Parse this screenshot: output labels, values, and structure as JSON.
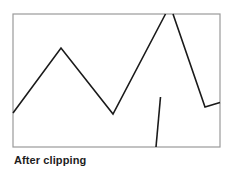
{
  "figure": {
    "caption": "After clipping",
    "caption_color": "#1d1d1d",
    "background_color": "#ffffff"
  },
  "clip_window": {
    "name": "clipping-rectangle",
    "x": 13,
    "y": 14,
    "width": 207,
    "height": 133,
    "stroke_color": "#9a9a9a",
    "stroke_width": 1.2,
    "fill_color": "#ffffff"
  },
  "chart_data": {
    "type": "line",
    "title": "After clipping",
    "xlabel": "",
    "ylabel": "",
    "grid": false,
    "legend": "none",
    "xlim": [
      13,
      220
    ],
    "ylim": [
      147,
      14
    ],
    "note": "Polyline clipped to the rectangular window; segments outside the window are removed and the peak is cut off at the top border.",
    "series": [
      {
        "name": "clipped-polyline-main",
        "stroke_color": "#1a1a1a",
        "stroke_width": 1.6,
        "points": [
          [
            13,
            113
          ],
          [
            61,
            48
          ],
          [
            113,
            114
          ],
          [
            165.5,
            14
          ]
        ]
      },
      {
        "name": "clipped-polyline-descending",
        "stroke_color": "#1a1a1a",
        "stroke_width": 1.6,
        "points": [
          [
            173,
            14
          ],
          [
            205,
            107
          ],
          [
            220,
            102.5
          ]
        ]
      },
      {
        "name": "clipped-segment-vertical",
        "stroke_color": "#1a1a1a",
        "stroke_width": 1.6,
        "points": [
          [
            160.5,
            97
          ],
          [
            156,
            147
          ]
        ]
      }
    ]
  }
}
